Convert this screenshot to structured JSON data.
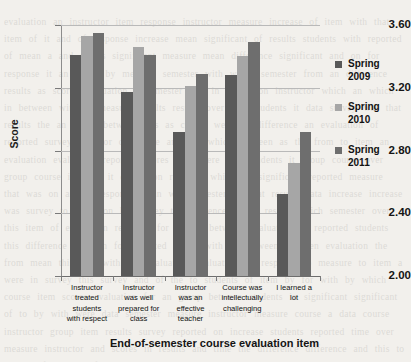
{
  "chart_data": {
    "type": "bar",
    "title": "",
    "xlabel": "End-of-semester course evaluation item",
    "ylabel": "Score",
    "ylim": [
      2.0,
      3.6
    ],
    "ytick_labels": [
      "2.00",
      "2.40",
      "2.80",
      "3.20",
      "3.60"
    ],
    "ytick_values": [
      2.0,
      2.4,
      2.8,
      3.2,
      3.6
    ],
    "grid": true,
    "legend_position": "right",
    "categories": [
      "Instructor treated students with respect",
      "Instructor was well prepared for class",
      "Instructor was an effective teacher",
      "Course was intellectually challenging",
      "I learned a lot"
    ],
    "category_label_lines": [
      [
        "Instructor",
        "treated",
        "students",
        "with respect"
      ],
      [
        "Instructor",
        "was well",
        "prepared for",
        "class"
      ],
      [
        "Instructor",
        "was an",
        "effective",
        "teacher"
      ],
      [
        "Course was",
        "intellectually",
        "challenging"
      ],
      [
        "I learned a",
        "lot"
      ]
    ],
    "series": [
      {
        "name": "Spring 2009",
        "name_lines": [
          "Spring",
          "2009"
        ],
        "color": "#595959",
        "values": [
          3.41,
          3.17,
          2.92,
          3.28,
          2.52
        ]
      },
      {
        "name": "Spring 2010",
        "name_lines": [
          "Spring",
          "2010"
        ],
        "color": "#a6a6a6",
        "values": [
          3.53,
          3.46,
          3.21,
          3.4,
          2.72
        ]
      },
      {
        "name": "Spring 2011",
        "name_lines": [
          "Spring",
          "2011"
        ],
        "color": "#6e6e6e",
        "values": [
          3.55,
          3.41,
          3.29,
          3.49,
          2.92
        ]
      }
    ]
  },
  "background_text": "of faint scanned text appears behind this figure from the reverse side of the page and is not part of the chart content"
}
